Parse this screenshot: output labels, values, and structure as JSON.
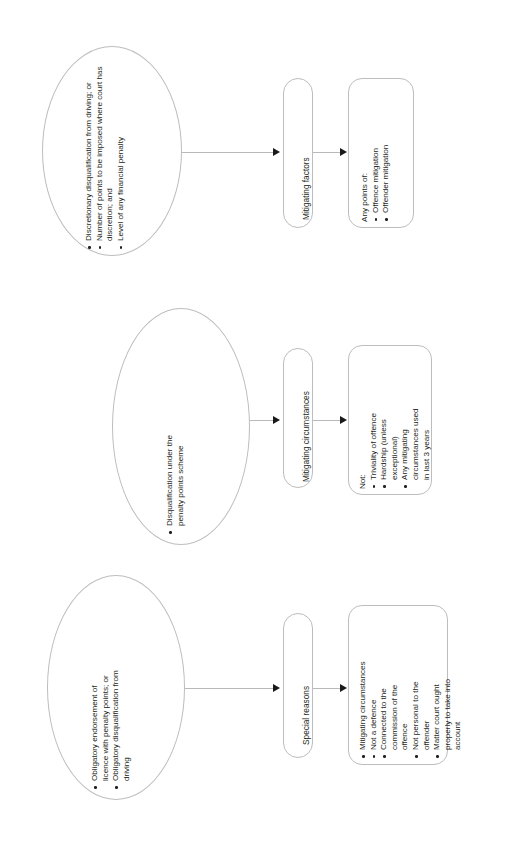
{
  "diagram": {
    "type": "flowchart",
    "orientation": "rotated-90-ccw",
    "colors": {
      "shape_stroke": "#bdbdbd",
      "connector": "#b9b9b9",
      "arrowhead": "#1a1a1a",
      "text": "#231f20",
      "background": "#ffffff"
    },
    "rows": [
      {
        "id": "row-1",
        "source": {
          "shape": "ellipse",
          "lead": "",
          "bullets": [
            "Discretionary disqualification from driving; or",
            "Number of points to be imposed where court has discretion; and",
            "Level of any financial penalty"
          ]
        },
        "stage": {
          "shape": "rounded-rect",
          "label": "Mitigating factors"
        },
        "detail": {
          "shape": "rounded-rect",
          "lead": "Any points of:",
          "bullets": [
            "Offence mitigation",
            "Offender mitigation"
          ]
        }
      },
      {
        "id": "row-2",
        "source": {
          "shape": "ellipse",
          "lead": "",
          "bullets": [
            "Disqualification under the penalty points scheme"
          ]
        },
        "stage": {
          "shape": "rounded-rect",
          "label": "Mitigating circumstances"
        },
        "detail": {
          "shape": "rounded-rect",
          "lead": "Not:",
          "bullets": [
            "Triviality of offence",
            "Hardship (unless exceptional)",
            "Any mitigating circumstances used in last 3 years"
          ]
        }
      },
      {
        "id": "row-3",
        "source": {
          "shape": "ellipse",
          "lead": "",
          "bullets": [
            "Obligatory endorsement of licence with penalty points; or",
            "Obligatory disqualification from driving"
          ]
        },
        "stage": {
          "shape": "rounded-rect",
          "label": "Special reasons"
        },
        "detail": {
          "shape": "rounded-rect",
          "lead": "",
          "bullets": [
            "Mitigating circumstances",
            "Not a defence",
            "Connected to the commission of the offence",
            "Not personal to the offender",
            "Matter court ought properly to take into account"
          ]
        }
      }
    ]
  }
}
